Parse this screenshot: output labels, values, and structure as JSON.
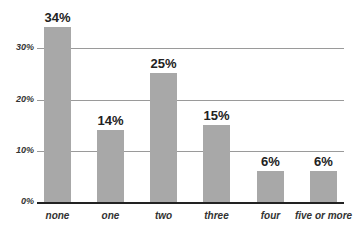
{
  "chart_data": {
    "type": "bar",
    "title": "",
    "xlabel": "",
    "ylabel": "",
    "categories": [
      "none",
      "one",
      "two",
      "three",
      "four",
      "five or more"
    ],
    "values": [
      34,
      14,
      25,
      15,
      6,
      6
    ],
    "value_labels": [
      "34%",
      "14%",
      "25%",
      "15%",
      "6%",
      "6%"
    ],
    "yticks": [
      "0%",
      "10%",
      "20%",
      "30%"
    ],
    "ylim": [
      0,
      35
    ],
    "grid": true,
    "legend": null,
    "bar_color": "#a8a8a8"
  }
}
